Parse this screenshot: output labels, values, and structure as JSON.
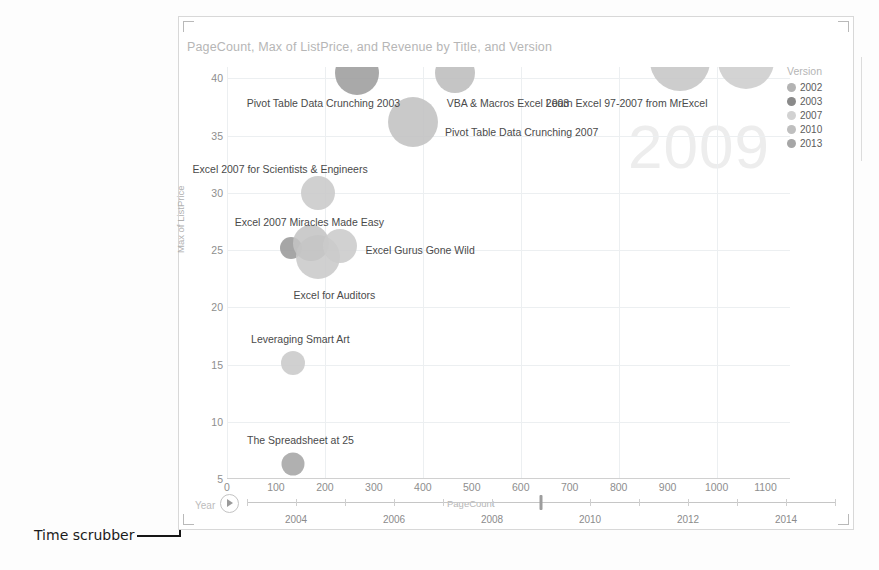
{
  "chart_data": {
    "type": "scatter",
    "title": "PageCount, Max of ListPrice, and Revenue by Title, and Version",
    "xlabel": "PageCount",
    "ylabel": "Max of ListPrice",
    "xlim": [
      0,
      1150
    ],
    "ylim": [
      5,
      41
    ],
    "xticks": [
      0,
      100,
      200,
      300,
      400,
      500,
      600,
      700,
      800,
      900,
      1000,
      1100
    ],
    "yticks": [
      5,
      10,
      15,
      20,
      25,
      30,
      35,
      40
    ],
    "grid": true,
    "legend_position": "right",
    "legend_title": "Version",
    "series": [
      {
        "name": "2002",
        "color": "#b0b0b0"
      },
      {
        "name": "2003",
        "color": "#8f8f8f"
      },
      {
        "name": "2007",
        "color": "#cfcfcf"
      },
      {
        "name": "2010",
        "color": "#bdbdbd"
      },
      {
        "name": "2013",
        "color": "#a8a8a8"
      }
    ],
    "points": [
      {
        "label": "Pivot Table Data Crunching 2003",
        "x": 265,
        "y": 40.5,
        "size": 44,
        "version": "2003",
        "color": "#9d9d9d",
        "label_dx": -110,
        "label_dy": 30
      },
      {
        "label": "VBA & Macros Excel 2003",
        "x": 465,
        "y": 40.5,
        "size": 40,
        "version": "2003",
        "color": "#bdbdbd",
        "label_dx": -8,
        "label_dy": 30
      },
      {
        "label": "Pivot Table Data Crunching 2007",
        "x": 380,
        "y": 36.2,
        "size": 50,
        "version": "2007",
        "color": "#c2c2c2",
        "label_dx": 32,
        "label_dy": 10
      },
      {
        "label": "Learn Excel 97-2007 from MrExcel",
        "x": 925,
        "y": 41.5,
        "size": 60,
        "version": "2007",
        "color": "#c6c6c6",
        "label_dx": -134,
        "label_dy": 42
      },
      {
        "label": "",
        "x": 1060,
        "y": 41.5,
        "size": 56,
        "version": "2007",
        "color": "#cdcdcd",
        "label_dx": 0,
        "label_dy": 0
      },
      {
        "label": "Excel 2007 for Scientists & Engineers",
        "x": 185,
        "y": 30.0,
        "size": 34,
        "version": "2007",
        "color": "#c9c9c9",
        "label_dx": -125,
        "label_dy": -24
      },
      {
        "label": "Excel 2007 Miracles Made Easy",
        "x": 130,
        "y": 25.2,
        "size": 22,
        "version": "2003",
        "color": "#9a9a9a",
        "label_dx": -56,
        "label_dy": -26
      },
      {
        "label": "Excel for Auditors",
        "x": 185,
        "y": 24.4,
        "size": 44,
        "version": "2007",
        "color": "#cacaca",
        "label_dx": -24,
        "label_dy": 38
      },
      {
        "label": "",
        "x": 172,
        "y": 25.6,
        "size": 36,
        "version": "2010",
        "color": "#c4c4c4",
        "label_dx": 0,
        "label_dy": 0
      },
      {
        "label": "Excel Gurus Gone Wild",
        "x": 230,
        "y": 25.4,
        "size": 34,
        "version": "2007",
        "color": "#cbcbcb",
        "label_dx": 26,
        "label_dy": 4
      },
      {
        "label": "Leveraging Smart Art",
        "x": 135,
        "y": 15.1,
        "size": 24,
        "version": "2007",
        "color": "#c9c9c9",
        "label_dx": -42,
        "label_dy": -24
      },
      {
        "label": "The Spreadsheet at 25",
        "x": 135,
        "y": 6.3,
        "size": 23,
        "version": "2013",
        "color": "#a5a5a5",
        "label_dx": -46,
        "label_dy": -24
      }
    ],
    "watermark": "2009"
  },
  "legend": {
    "title": "Version",
    "items": [
      {
        "label": "2002",
        "color": "#b3b3b3"
      },
      {
        "label": "2003",
        "color": "#8a8a8a"
      },
      {
        "label": "2007",
        "color": "#d2d2d2"
      },
      {
        "label": "2010",
        "color": "#bfbfbf"
      },
      {
        "label": "2013",
        "color": "#a6a6a6"
      }
    ]
  },
  "scrubber": {
    "label": "Year",
    "play_icon": "play-icon",
    "ticks": [
      2003,
      2004,
      2005,
      2006,
      2007,
      2008,
      2009,
      2010,
      2011,
      2012,
      2013,
      2014,
      2015
    ],
    "tick_labels": [
      {
        "value": 2004,
        "text": "2004"
      },
      {
        "value": 2006,
        "text": "2006"
      },
      {
        "value": 2008,
        "text": "2008"
      },
      {
        "value": 2010,
        "text": "2010"
      },
      {
        "value": 2012,
        "text": "2012"
      },
      {
        "value": 2014,
        "text": "2014"
      }
    ],
    "range": [
      2003,
      2015
    ],
    "current_value": 2009
  },
  "annotation": {
    "text": "Time scrubber"
  }
}
